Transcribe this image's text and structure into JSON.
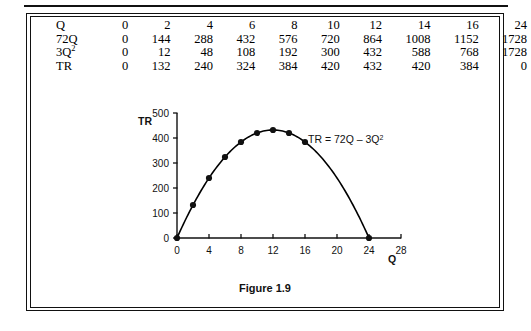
{
  "figure": {
    "caption": "Figure 1.9"
  },
  "table": {
    "rows": [
      {
        "label": "Q",
        "label_sup": "",
        "values": [
          "0",
          "2",
          "4",
          "6",
          "8",
          "10",
          "12",
          "14",
          "16",
          "24"
        ]
      },
      {
        "label": "72Q",
        "label_sup": "",
        "values": [
          "0",
          "144",
          "288",
          "432",
          "576",
          "720",
          "864",
          "1008",
          "1152",
          "1728"
        ]
      },
      {
        "label": "3Q",
        "label_sup": "2",
        "values": [
          "0",
          "12",
          "48",
          "108",
          "192",
          "300",
          "432",
          "588",
          "768",
          "1728"
        ]
      },
      {
        "label": "TR",
        "label_sup": "",
        "values": [
          "0",
          "132",
          "240",
          "324",
          "384",
          "420",
          "432",
          "420",
          "384",
          "0"
        ]
      }
    ]
  },
  "chart_data": {
    "type": "line",
    "title": "",
    "equation_label": "TR = 72Q – 3Q",
    "equation_label_sup": "2",
    "xlabel": "Q",
    "ylabel": "TR",
    "xlim": [
      0,
      28
    ],
    "ylim": [
      0,
      500
    ],
    "xticks": [
      "0",
      "4",
      "8",
      "12",
      "16",
      "20",
      "24",
      "28"
    ],
    "xtick_values": [
      0,
      4,
      8,
      12,
      16,
      20,
      24,
      28
    ],
    "yticks": [
      "0",
      "100",
      "200",
      "300",
      "400",
      "500"
    ],
    "ytick_values": [
      0,
      100,
      200,
      300,
      400,
      500
    ],
    "grid": false,
    "legend": "none",
    "marker": "filled-circle",
    "x": [
      0,
      2,
      4,
      6,
      8,
      10,
      12,
      14,
      16,
      24
    ],
    "values": [
      0,
      132,
      240,
      324,
      384,
      420,
      432,
      420,
      384,
      0
    ],
    "series": [
      {
        "name": "TR",
        "x": [
          0,
          2,
          4,
          6,
          8,
          10,
          12,
          14,
          16,
          24
        ],
        "values": [
          0,
          132,
          240,
          324,
          384,
          420,
          432,
          420,
          384,
          0
        ]
      }
    ],
    "curve_formula": "TR = 72Q - 3Q^2",
    "curve_color": "#000000"
  }
}
